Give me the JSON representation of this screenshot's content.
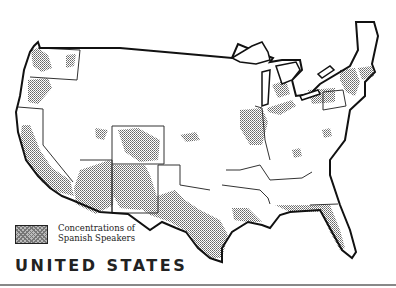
{
  "map": {
    "title_word1": "UNITED",
    "title_word2": "STATES",
    "colors": {
      "outline": "#111111",
      "state_border": "#333333",
      "concentration_fill": "#999999",
      "background": "#ffffff"
    }
  },
  "legend": {
    "line1": "Concentrations of",
    "line2": "Spanish Speakers",
    "swatch": "stippled-gray-pattern"
  }
}
